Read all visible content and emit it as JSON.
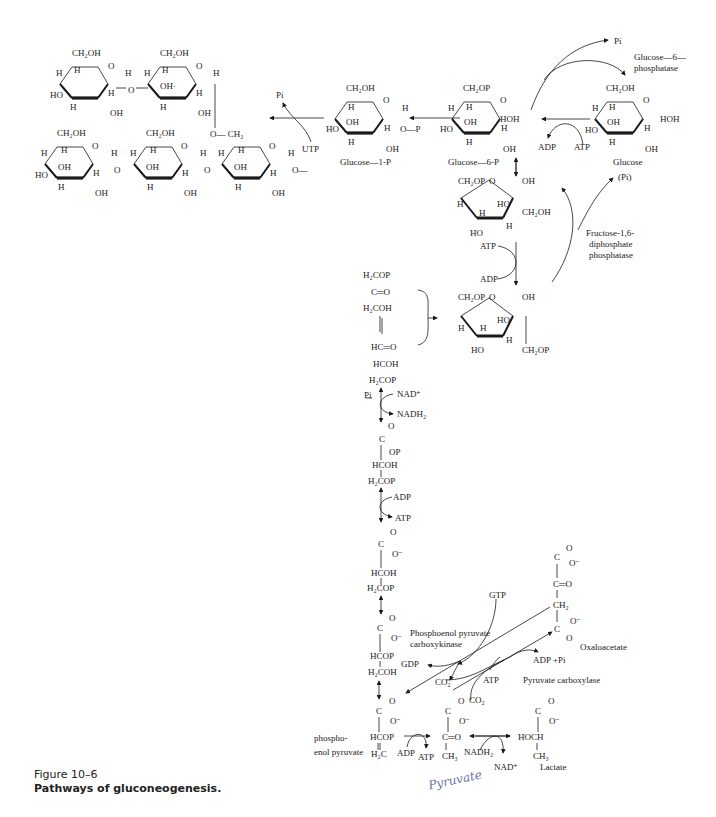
{
  "figure": {
    "number": "Figure 10–6",
    "title": "Pathways of gluconeogenesis.",
    "handwritten_note": "Pyruvate"
  },
  "glycogen": {
    "ring_labels": [
      "CH2OH",
      "H",
      "O",
      "H",
      "HO",
      "OH",
      "H",
      "OH",
      "O",
      "O—CH2",
      "O—"
    ]
  },
  "compounds": {
    "glucose_1_p": "Glucose—1-P",
    "glucose_6_p": "Glucose—6-P",
    "glucose": "Glucose",
    "oxaloacetate": "Oxaloacetate",
    "lactate": "Lactate",
    "phosphoenol_pyruvate": [
      "phospho-",
      "enol pyruvate"
    ]
  },
  "enzymes": {
    "glucose_6_phosphatase": [
      "Glucose—6—",
      "phosphatase"
    ],
    "fructose_bisphosphatase": [
      "Fructose-1,6-",
      "diphosphate",
      "phosphatase"
    ],
    "pepck": [
      "Phosphoenol pyruvate",
      "carboxykinase"
    ],
    "pyruvate_carboxylase": "Pyruvate carboxylase"
  },
  "cofactors": {
    "pi_top": "Pi",
    "pi_glycogen": "Pi",
    "utp": "UTP",
    "adp_glucose": "ADP",
    "atp_glucose": "ATP",
    "pi_fructose": "(Pi)",
    "atp_fructose": "ATP",
    "adp_fructose": "ADP",
    "pi_gap": "Pi",
    "nad_plus": "NAD⁺",
    "nadh2": "NADH₂",
    "adp_pgk": "ADP",
    "atp_pgk": "ATP",
    "gtp": "GTP",
    "gdp": "GDP",
    "co2_a": "CO₂",
    "co2_b": "CO₂",
    "atp_pc": "ATP",
    "adp_pi": "ADP +Pi",
    "adp_pk": "ADP",
    "atp_pk": "ATP",
    "nadh2_ldh": "NADH₂",
    "nad_ldh": "NAD⁺"
  },
  "intermediates": {
    "dhap": [
      "H₂COP",
      "C═O",
      "H₂COH"
    ],
    "gap": [
      "HC═O",
      "HCOH",
      "H₂COP"
    ],
    "bpg": [
      "O",
      "C",
      "OP",
      "HCOH",
      "H₂COP"
    ],
    "pg3": [
      "O",
      "C",
      "O⁻",
      "HCOH",
      "H₂COP"
    ],
    "pg2": [
      "O",
      "C",
      "O⁻",
      "HCOP",
      "H₂COH"
    ],
    "pep": [
      "O",
      "C",
      "O⁻",
      "HCOP",
      "H₂C"
    ],
    "pyruvate": [
      "O",
      "C",
      "O⁻",
      "C═O",
      "CH₃"
    ],
    "lactate": [
      "O",
      "C",
      "O⁻",
      "HOCH",
      "CH₃"
    ],
    "oaa": [
      "O",
      "C",
      "O⁻",
      "C═O",
      "CH₂",
      "O⁻",
      "C",
      "O"
    ]
  },
  "ring_text": {
    "ch2oh": "CH₂OH",
    "ch2op": "CH₂OP",
    "h": "H",
    "o": "O",
    "oh": "OH",
    "ho": "HO",
    "hoh": "HOH",
    "op": "O—P",
    "och2": "O—CH₂",
    "olink": "O—",
    "ohdot": "OH·"
  }
}
